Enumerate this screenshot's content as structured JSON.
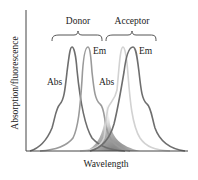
{
  "diagram": {
    "xlabel": "Wavelength",
    "ylabel": "Absorption/fluorescence",
    "groups": [
      {
        "name": "Donor",
        "bracket_label": "Donor"
      },
      {
        "name": "Acceptor",
        "bracket_label": "Acceptor"
      }
    ],
    "curves": [
      {
        "id": "donor-abs",
        "label": "Abs",
        "group": "Donor",
        "color": "#6e6e6e"
      },
      {
        "id": "donor-em",
        "label": "Em",
        "group": "Donor",
        "color": "#9a9a9a"
      },
      {
        "id": "acceptor-abs",
        "label": "Abs",
        "group": "Acceptor",
        "color": "#d2d2d2"
      },
      {
        "id": "acceptor-em",
        "label": "Em",
        "group": "Acceptor",
        "color": "#6e6e6e"
      }
    ],
    "overlap_region": {
      "description": "Donor emission / acceptor absorption spectral overlap",
      "color": "#7a7a7a"
    },
    "colors": {
      "axis": "#444444",
      "text": "#222222",
      "bracket": "#555555"
    }
  }
}
